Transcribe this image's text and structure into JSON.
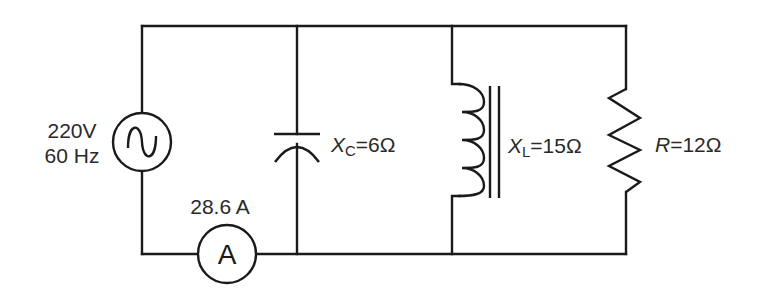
{
  "diagram": {
    "type": "AC parallel RLC circuit",
    "source": {
      "voltage_label": "220V",
      "frequency_label": "60 Hz",
      "symbol": "ac-source-sine"
    },
    "ammeter": {
      "reading_label": "28.6 A",
      "symbol_letter": "A"
    },
    "capacitor": {
      "symbol": "X",
      "subscript": "C",
      "value": "=6Ω"
    },
    "inductor": {
      "symbol": "X",
      "subscript": "L",
      "value": "=15Ω",
      "core": "iron-core"
    },
    "resistor": {
      "symbol": "R",
      "value": "=12Ω"
    }
  },
  "colors": {
    "line": "#1a1a1a",
    "text": "#2a2a2a",
    "background": "#ffffff"
  }
}
